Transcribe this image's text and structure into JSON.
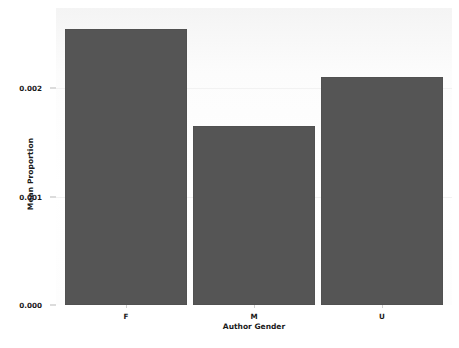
{
  "chart_data": {
    "type": "bar",
    "title": "",
    "subtitle": "",
    "xlabel": "Author Gender",
    "ylabel": "Mean Proportion",
    "categories": [
      "F",
      "M",
      "U"
    ],
    "values": [
      0.00255,
      0.00165,
      0.0021
    ],
    "series": [
      {
        "name": "Mean Proportion",
        "values": [
          0.00255,
          0.00165,
          0.0021
        ]
      }
    ],
    "ylim": [
      0.0,
      0.00274
    ],
    "xlim": [
      -0.5,
      2.5
    ],
    "ytick_labels": [
      "0.000",
      "0.001",
      "0.002"
    ],
    "ytick_values": [
      0.0,
      0.001,
      0.002
    ],
    "xtick_labels": [
      "F",
      "M",
      "U"
    ],
    "grid": false,
    "legend": null,
    "legend_position": "none",
    "annotations": [],
    "colors": {
      "bar": "#555555",
      "plot_background": "#fbfbfb",
      "figure_background": "#ffffff",
      "text": "#1a1a1a",
      "tick": "#b9b9b9"
    }
  }
}
